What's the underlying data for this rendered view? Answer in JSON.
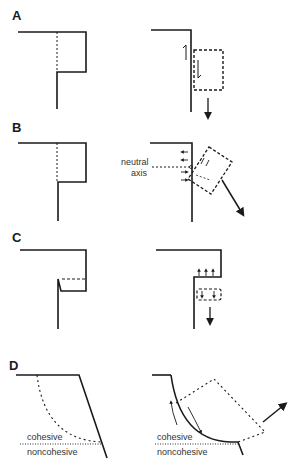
{
  "figure": {
    "panels": [
      {
        "id": "A",
        "label": "A"
      },
      {
        "id": "B",
        "label": "B",
        "annotation_line1": "neutral",
        "annotation_line2": "axis"
      },
      {
        "id": "C",
        "label": "C"
      },
      {
        "id": "D",
        "label": "D",
        "layer_upper": "cohesive",
        "layer_lower": "noncohesive",
        "layer_upper_right": "cohesive",
        "layer_lower_right": "noncohesive"
      }
    ],
    "colors": {
      "line": "#1a1a1a",
      "dashed": "#333333",
      "background": "#ffffff"
    }
  }
}
